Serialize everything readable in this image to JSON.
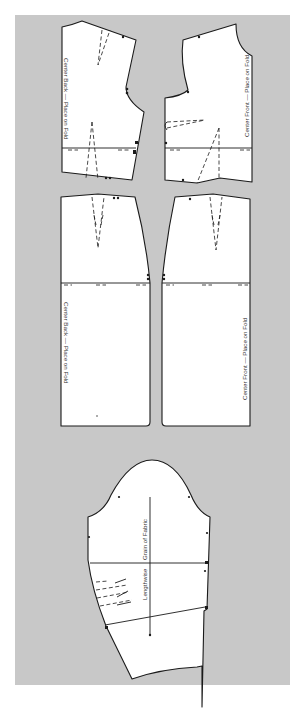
{
  "colors": {
    "background": "#ffffff",
    "panel": "#c8c8c8",
    "piece_fill": "#ffffff",
    "outline": "#1a1a1a"
  },
  "pieces": {
    "back_bodice": {
      "label": "Center Back — Place on Fold"
    },
    "front_bodice": {
      "label": "Center Front — Place on Fold"
    },
    "back_skirt": {
      "label": "Center Back — Place on Fold"
    },
    "front_skirt": {
      "label": "Center Front — Place on Fold"
    },
    "sleeve": {
      "grain_label": "Grain of Fabric",
      "lengthwise_label": "Lengthwise"
    }
  }
}
